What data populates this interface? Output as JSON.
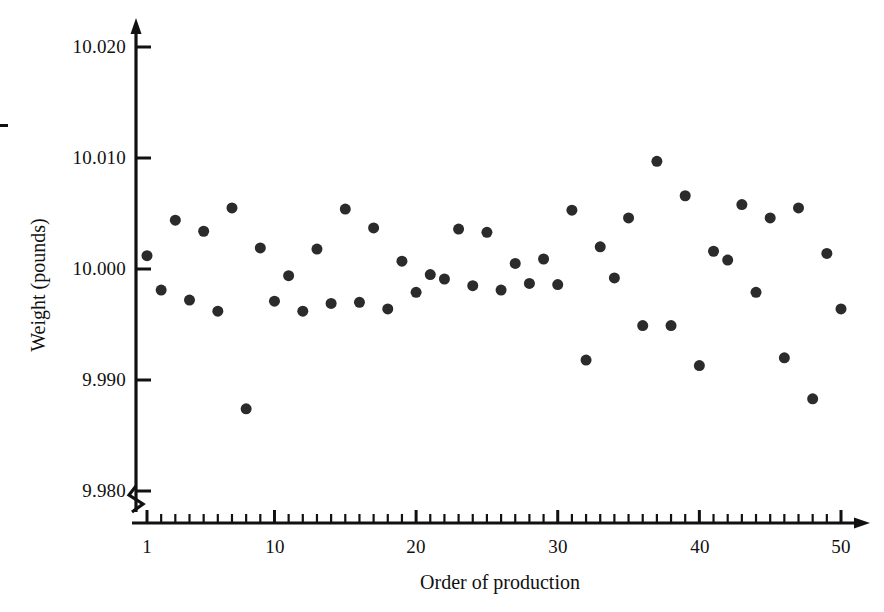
{
  "chart_data": {
    "type": "scatter",
    "title": "",
    "xlabel": "Order of production",
    "ylabel": "Weight (pounds)",
    "xlim": [
      1,
      50
    ],
    "ylim": [
      9.98,
      10.02
    ],
    "grid": false,
    "legend": null,
    "axis_break_y": true,
    "marker": {
      "shape": "circle",
      "color": "#2b2b2b",
      "size_px": 11
    },
    "y_ticks": [
      "9.980",
      "9.990",
      "10.000",
      "10.010",
      "10.020"
    ],
    "y_tick_values": [
      9.98,
      9.99,
      10.0,
      10.01,
      10.02
    ],
    "x_ticks": [
      "1",
      "10",
      "20",
      "30",
      "40",
      "50"
    ],
    "x_tick_values": [
      1,
      10,
      20,
      30,
      40,
      50
    ],
    "x_minor_tick_step": 1,
    "x": [
      1,
      2,
      3,
      4,
      5,
      6,
      7,
      8,
      9,
      10,
      11,
      12,
      13,
      14,
      15,
      16,
      17,
      18,
      19,
      20,
      21,
      22,
      23,
      24,
      25,
      26,
      27,
      28,
      29,
      30,
      31,
      32,
      33,
      34,
      35,
      36,
      37,
      38,
      39,
      40,
      41,
      42,
      43,
      44,
      45,
      46,
      47,
      48,
      49,
      50
    ],
    "y": [
      10.0012,
      9.9981,
      10.0044,
      9.9972,
      10.0034,
      9.9962,
      10.0055,
      9.9874,
      10.0019,
      9.9971,
      9.9994,
      9.9962,
      10.0018,
      9.9969,
      10.0054,
      9.997,
      10.0037,
      9.9964,
      10.0007,
      9.9979,
      9.9995,
      9.9991,
      10.0036,
      9.9985,
      10.0033,
      9.9981,
      10.0005,
      9.9987,
      10.0009,
      9.9986,
      10.0053,
      9.9918,
      10.002,
      9.9992,
      10.0046,
      9.9949,
      10.0097,
      9.9949,
      10.0066,
      9.9913,
      10.0016,
      10.0008,
      10.0058,
      9.9979,
      10.0046,
      9.992,
      10.0055,
      9.9883,
      10.0014,
      9.9964
    ]
  },
  "axes": {
    "y_title": "Weight (pounds)",
    "x_title": "Order of production",
    "y_tick_labels": [
      "10.020",
      "10.010",
      "10.000",
      "9.990",
      "9.980"
    ],
    "x_tick_labels": [
      "1",
      "10",
      "20",
      "30",
      "40",
      "50"
    ]
  }
}
